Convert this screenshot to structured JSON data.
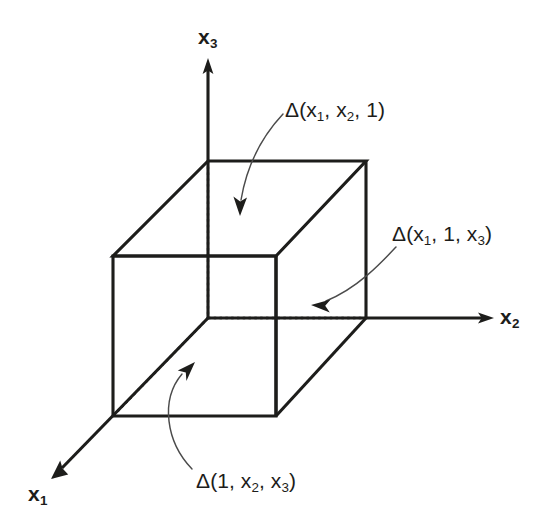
{
  "figure": {
    "kind": "3d-cube-axes-diagram",
    "background_color": "#ffffff",
    "line_color": "#1d1d1b",
    "callout_color": "#4b4b4b",
    "width": 542,
    "height": 529
  },
  "axes": [
    {
      "id": "x1",
      "label": "x",
      "subscript": "1",
      "direction": "down-left",
      "label_position": {
        "x": 28,
        "y": 483
      }
    },
    {
      "id": "x2",
      "label": "x",
      "subscript": "2",
      "direction": "right",
      "label_position": {
        "x": 500,
        "y": 306
      }
    },
    {
      "id": "x3",
      "label": "x",
      "subscript": "3",
      "direction": "up",
      "label_position": {
        "x": 198,
        "y": 26
      }
    }
  ],
  "callouts": [
    {
      "id": "delta-top",
      "text_parts": [
        "Δ(x",
        "1",
        ", x",
        "2",
        ", 1)"
      ],
      "full_text": "Δ(x₁, x₂, 1)",
      "points_to": "top-face",
      "label_position": {
        "x": 285,
        "y": 99
      }
    },
    {
      "id": "delta-right",
      "text_parts": [
        "Δ(x",
        "1",
        ", 1, x",
        "3",
        ")"
      ],
      "full_text": "Δ(x₁, 1, x₃)",
      "points_to": "right-face",
      "label_position": {
        "x": 392,
        "y": 223
      }
    },
    {
      "id": "delta-bottom",
      "text_parts": [
        "Δ(1, x",
        "2",
        ", x",
        "3",
        ")"
      ],
      "full_text": "Δ(1, x₂, x₃)",
      "points_to": "bottom-face-diagonal",
      "label_position": {
        "x": 196,
        "y": 470
      }
    }
  ],
  "cube": {
    "origin": {
      "x": 208,
      "y": 318
    },
    "vertices": {
      "back_top_left": {
        "x": 208,
        "y": 161
      },
      "back_top_right": {
        "x": 366,
        "y": 161
      },
      "front_top_left": {
        "x": 113,
        "y": 256
      },
      "front_top_right": {
        "x": 276,
        "y": 256
      },
      "back_bottom_right": {
        "x": 366,
        "y": 318
      },
      "front_bottom_left": {
        "x": 113,
        "y": 416
      },
      "front_bottom_right": {
        "x": 276,
        "y": 416
      }
    },
    "hidden_edges": [
      "origin-to-back_top_left",
      "origin-to-back_bottom_right",
      "origin-to-front_bottom_left"
    ]
  }
}
